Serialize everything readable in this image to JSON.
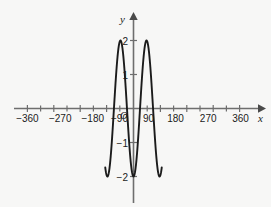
{
  "figure": {
    "background_color": "#f7f7f6",
    "axis_color": "#6e6e6e",
    "curve_color": "#1b1b1b",
    "text_color": "#1b1b1b"
  },
  "axes": {
    "x_axis_label": "x",
    "y_axis_label": "y",
    "origin_label": "O"
  },
  "chart_data": {
    "type": "line",
    "title": "",
    "xlabel": "x",
    "ylabel": "y",
    "grid": false,
    "legend": null,
    "xlim": [
      -400,
      400
    ],
    "ylim": [
      -2.6,
      2.6
    ],
    "xticks": [
      -360,
      -270,
      -180,
      -90,
      90,
      180,
      270,
      360
    ],
    "xtick_labels": [
      "−360",
      "−270",
      "−180",
      "−90",
      "90",
      "180",
      "270",
      "360"
    ],
    "yticks": [
      2,
      1,
      -1,
      -2
    ],
    "ytick_labels": [
      "2",
      "1",
      "−1",
      "−2"
    ],
    "function": "y = −2cos(x)",
    "amplitude": 2,
    "period": 360,
    "series": [
      {
        "name": "y = −2cos(x)",
        "x": [
          -390,
          -380,
          -370,
          -360,
          -350,
          -340,
          -330,
          -320,
          -310,
          -300,
          -290,
          -280,
          -270,
          -260,
          -250,
          -240,
          -230,
          -220,
          -210,
          -200,
          -190,
          -180,
          -170,
          -160,
          -150,
          -140,
          -130,
          -120,
          -110,
          -100,
          -90,
          -80,
          -70,
          -60,
          -50,
          -40,
          -30,
          -20,
          -10,
          0,
          10,
          20,
          30,
          40,
          50,
          60,
          70,
          80,
          90,
          100,
          110,
          120,
          130,
          140,
          150,
          160,
          170,
          180,
          190,
          200,
          210,
          220,
          230,
          240,
          250,
          260,
          270,
          280,
          290,
          300,
          310,
          320,
          330,
          340,
          350,
          360,
          370,
          380,
          390
        ],
        "y": [
          -1.73,
          -1.88,
          -1.97,
          -2.0,
          -1.97,
          -1.88,
          -1.73,
          -1.53,
          -1.29,
          -1.0,
          -0.68,
          -0.35,
          0.0,
          0.35,
          0.68,
          1.0,
          1.29,
          1.53,
          1.73,
          1.88,
          1.97,
          2.0,
          1.97,
          1.88,
          1.73,
          1.53,
          1.29,
          1.0,
          0.68,
          0.35,
          0.0,
          -0.35,
          -0.68,
          -1.0,
          -1.29,
          -1.53,
          -1.73,
          -1.88,
          -1.97,
          -2.0,
          -1.97,
          -1.88,
          -1.73,
          -1.53,
          -1.29,
          -1.0,
          -0.68,
          -0.35,
          0.0,
          0.35,
          0.68,
          1.0,
          1.29,
          1.53,
          1.73,
          1.88,
          1.97,
          2.0,
          1.97,
          1.88,
          1.73,
          1.53,
          1.29,
          1.0,
          0.68,
          0.35,
          0.0,
          -0.35,
          -0.68,
          -1.0,
          -1.29,
          -1.53,
          -1.73,
          -1.88,
          -1.97,
          -2.0,
          -1.97,
          -1.88,
          -1.73
        ],
        "maxima": [
          {
            "x": -180,
            "y": 2
          },
          {
            "x": 180,
            "y": 2
          }
        ],
        "minima": [
          {
            "x": -360,
            "y": -2
          },
          {
            "x": 0,
            "y": -2
          },
          {
            "x": 360,
            "y": -2
          }
        ],
        "x_intercepts": [
          -270,
          -90,
          90,
          270
        ],
        "domain_drawn": [
          -390,
          390
        ]
      }
    ]
  }
}
